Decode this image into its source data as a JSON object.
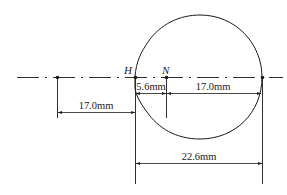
{
  "diagram": {
    "points": [
      {
        "id": "left-point",
        "label": "",
        "x": 57
      },
      {
        "id": "H",
        "label": "H",
        "x": 135
      },
      {
        "id": "N",
        "label": "N",
        "x": 166
      },
      {
        "id": "right-point",
        "label": "",
        "x": 262
      }
    ],
    "labels": {
      "H": "H",
      "N": "N"
    },
    "dimensions": {
      "left_span": "17.0mm",
      "h_to_n": "5.6mm",
      "n_to_right": "17.0mm",
      "total_width": "22.6mm"
    },
    "colors": {
      "stroke": "#1a1a1a",
      "background": "#ffffff"
    }
  }
}
